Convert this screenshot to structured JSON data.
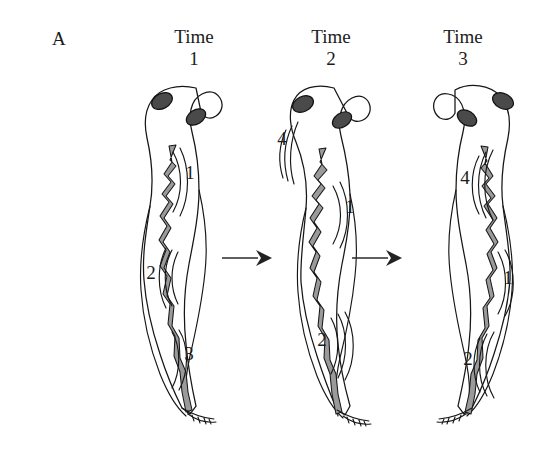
{
  "figure": {
    "panel_label": "A",
    "background_color": "#ffffff",
    "ink_color": "#161616"
  },
  "columns": [
    {
      "time_word": "Time",
      "time_number": "1"
    },
    {
      "time_word": "Time",
      "time_number": "2"
    },
    {
      "time_word": "Time",
      "time_number": "3"
    }
  ],
  "specimens": [
    {
      "name": "tadpole-time-1",
      "wave_labels": [
        {
          "text": "1",
          "x": 189,
          "y": 172
        },
        {
          "text": "2",
          "x": 150,
          "y": 272
        },
        {
          "text": "3",
          "x": 188,
          "y": 353
        }
      ]
    },
    {
      "name": "tadpole-time-2",
      "wave_labels": [
        {
          "text": "4",
          "x": 281,
          "y": 137
        },
        {
          "text": "1",
          "x": 349,
          "y": 205
        },
        {
          "text": "2",
          "x": 321,
          "y": 338
        }
      ]
    },
    {
      "name": "tadpole-time-3",
      "wave_labels": [
        {
          "text": "4",
          "x": 464,
          "y": 176
        },
        {
          "text": "1",
          "x": 507,
          "y": 276
        },
        {
          "text": "2",
          "x": 467,
          "y": 357
        }
      ]
    }
  ],
  "arrows": [
    {
      "name": "progression-arrow-1-to-2",
      "x": 222,
      "y": 258
    },
    {
      "name": "progression-arrow-2-to-3",
      "x": 352,
      "y": 258
    }
  ]
}
